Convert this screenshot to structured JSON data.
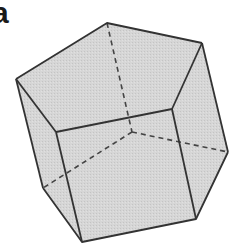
{
  "figure": {
    "panel_label": "a",
    "colors": {
      "face_fill": "#d3d3d3",
      "edge": "#333333",
      "hidden_edge": "#444444"
    },
    "vertices": {
      "top": [
        107,
        23
      ],
      "right_top": [
        202,
        43
      ],
      "left_top": [
        16,
        79
      ],
      "front_top_right": [
        172,
        109
      ],
      "front_top_left": [
        56,
        132
      ],
      "hidden_center": [
        132,
        132
      ],
      "right_lower": [
        228,
        152
      ],
      "left_lower": [
        43,
        188
      ],
      "front_bottom_right": [
        196,
        219
      ],
      "front_bottom_left": [
        82,
        242
      ]
    }
  }
}
